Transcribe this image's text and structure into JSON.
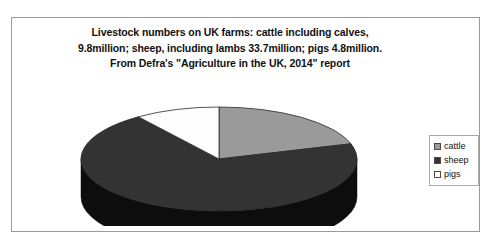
{
  "frame": {
    "border_color": "#9b9b9b"
  },
  "chart_data": {
    "type": "pie",
    "title": "Livestock numbers on UK farms: cattle including calves, 9.8million; sheep, including lambs 33.7million; pigs 4.8million. From Defra's \"Agriculture in the UK, 2014\" report",
    "title_lines": [
      "Livestock numbers on UK farms: cattle including calves,",
      "9.8million; sheep, including lambs 33.7million; pigs 4.8million.",
      "From Defra's \"Agriculture in the UK, 2014\" report"
    ],
    "xlabel": "",
    "ylabel": "",
    "units": "million head",
    "source": "Defra, \"Agriculture in the UK, 2014\" report",
    "total": 48.3,
    "three_d": true,
    "grid": false,
    "legend_position": "right",
    "categories": [
      "cattle",
      "sheep",
      "pigs"
    ],
    "values": [
      9.8,
      33.7,
      4.8
    ],
    "percentages": [
      20.3,
      69.8,
      9.9
    ],
    "slices": [
      {
        "label": "cattle",
        "value": 9.8,
        "percent": 20.3,
        "color": "#9a9a9a",
        "side_color": "#4d4d4d",
        "start_angle": 0,
        "end_angle": 73.0
      },
      {
        "label": "sheep",
        "value": 33.7,
        "percent": 69.8,
        "color": "#333333",
        "side_color": "#0d0d0d",
        "start_angle": 73.0,
        "end_angle": 324.2
      },
      {
        "label": "pigs",
        "value": 4.8,
        "percent": 9.9,
        "color": "#fdfdfd",
        "side_color": "#9a9a9a",
        "start_angle": 324.2,
        "end_angle": 360
      }
    ]
  },
  "legend": {
    "items": [
      {
        "label": "cattle",
        "color": "#9a9a9a"
      },
      {
        "label": "sheep",
        "color": "#333333"
      },
      {
        "label": "pigs",
        "color": "#ffffff"
      }
    ]
  }
}
